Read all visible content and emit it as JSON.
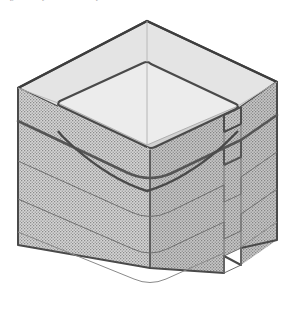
{
  "figure": {
    "kind": "isometric-technical-drawing",
    "caption_clipped": "Figure 4. Layered mould body",
    "background_color": "#ffffff",
    "canvas": {
      "width": 293,
      "height": 311
    }
  },
  "palette": {
    "outline_dark": "#4a4a4a",
    "outline_heavy": "#3d3d3d",
    "outline_light": "#9b9b9b",
    "top_rim_face": "#e3e3e3",
    "inner_wall_left": "#d7d7d7",
    "inner_wall_right": "#cfcfcf",
    "inner_floor": "#e6e6e6",
    "hatch_base_left": "#d2d2d2",
    "hatch_base_right": "#c4c4c4",
    "hatch_dot": "#8f8f8f",
    "band_line": "#6f6f6f"
  },
  "geometry": {
    "projection": "isometric",
    "apex_back": {
      "x": 147,
      "y": 21
    },
    "corner_left": {
      "x": 18,
      "y": 88
    },
    "corner_right": {
      "x": 277,
      "y": 82
    },
    "corner_front_top": {
      "x": 150,
      "y": 150
    },
    "corner_front_bottom": {
      "x": 150,
      "y": 268
    },
    "wall_height_px": 157,
    "notch": {
      "depth_px": 17,
      "at_edge": "right-front"
    },
    "inner_corner_radius_px": 26
  },
  "layers": {
    "count": 4,
    "separators": [
      {
        "index": 1,
        "weight": "heavy",
        "label": "band-1"
      },
      {
        "index": 2,
        "weight": "light",
        "label": "band-2"
      },
      {
        "index": 3,
        "weight": "light",
        "label": "band-3"
      },
      {
        "index": 4,
        "weight": "light",
        "label": "band-4"
      }
    ]
  },
  "surfaces": [
    {
      "id": "top-rim",
      "label": "top rim face",
      "shading": "flat-light"
    },
    {
      "id": "inner-wall-left",
      "label": "inner wall (left)",
      "shading": "flat-mid"
    },
    {
      "id": "inner-wall-right",
      "label": "inner wall (right)",
      "shading": "flat-mid"
    },
    {
      "id": "inner-floor",
      "label": "cavity floor",
      "shading": "flat-light"
    },
    {
      "id": "outer-wall-left",
      "label": "outer wall (left)",
      "shading": "stipple"
    },
    {
      "id": "outer-wall-right",
      "label": "outer wall (right)",
      "shading": "stipple"
    },
    {
      "id": "notch-face",
      "label": "notch return face",
      "shading": "stipple"
    }
  ]
}
